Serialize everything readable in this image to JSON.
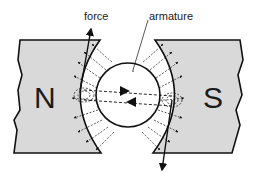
{
  "diagram": {
    "labels": {
      "force": "force",
      "armature": "armature",
      "north_pole": "N",
      "south_pole": "S"
    },
    "colors": {
      "pole_fill": "#d9d9d9",
      "line": "#111111",
      "background": "#ffffff"
    }
  }
}
